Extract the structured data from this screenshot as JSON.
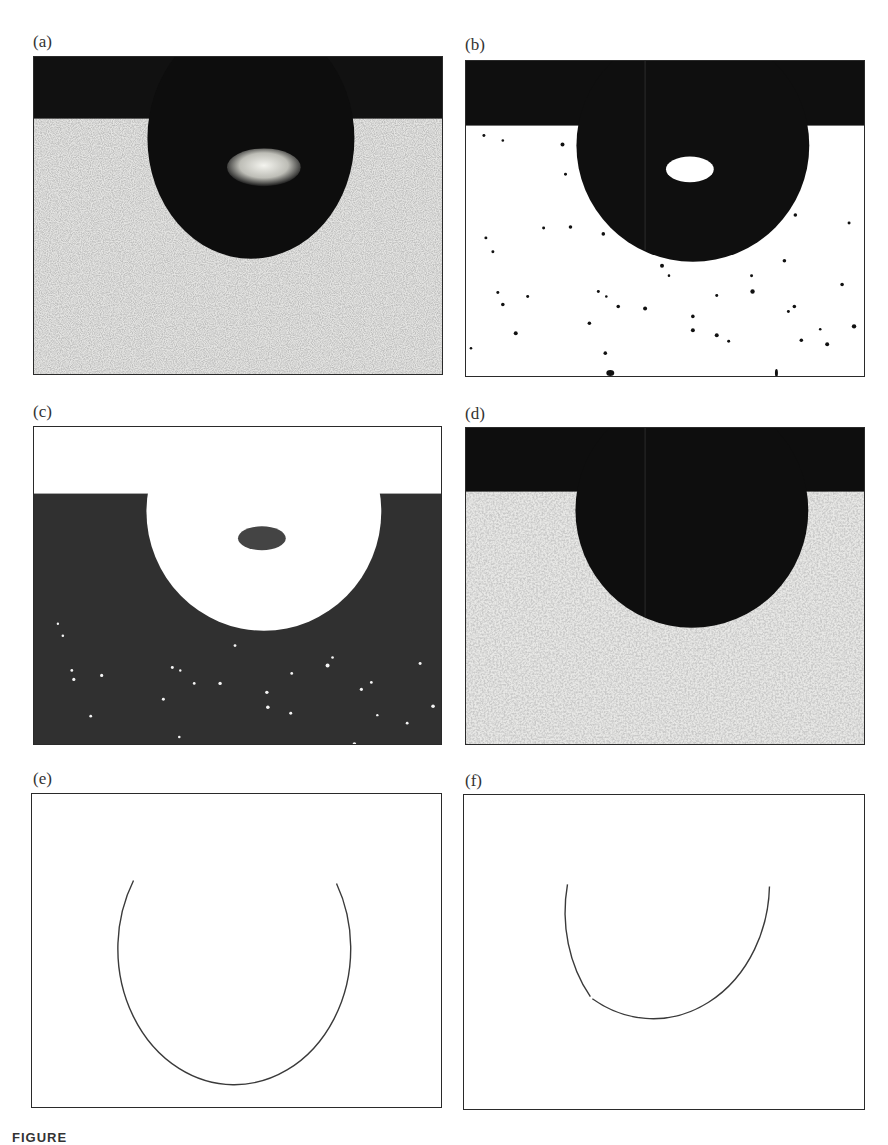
{
  "figure": {
    "caption_prefix": "FIGURE",
    "caption_text": "",
    "panels": [
      {
        "id": "a",
        "label": "(a)",
        "type": "grayscale-photo",
        "description": "Sessile drop on speckled substrate with bright central highlight"
      },
      {
        "id": "b",
        "label": "(b)",
        "type": "binary-threshold",
        "description": "Thresholded image: black drop with white highlight on white background with black specks"
      },
      {
        "id": "c",
        "label": "(c)",
        "type": "inverted-binary",
        "description": "Inverted image: white drop and upper region with dark inner spot on dark background with white specks"
      },
      {
        "id": "d",
        "label": "(d)",
        "type": "filled-grayscale",
        "description": "Drop with highlight filled in, solid black drop on speckled substrate"
      },
      {
        "id": "e",
        "label": "(e)",
        "type": "edge-contour",
        "description": "Extracted drop contour arc"
      },
      {
        "id": "f",
        "label": "(f)",
        "type": "edge-contour",
        "description": "Extracted drop contour arc (alternate method)"
      }
    ]
  },
  "colors": {
    "dark_band": "#111111",
    "drop": "#0d0d0d",
    "substrate_light": "#e6e6e6",
    "speck": "#555555",
    "highlight": "#f2f2ee",
    "inverted_bg": "#303030",
    "contour": "#3a3a3a"
  }
}
